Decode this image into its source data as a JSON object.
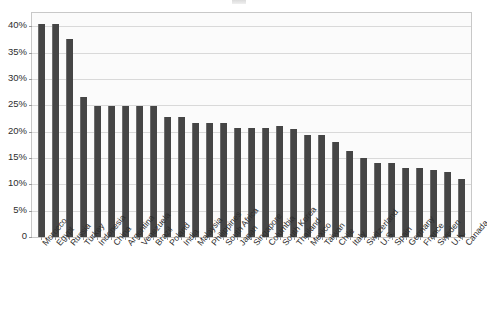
{
  "chart_data": {
    "type": "bar",
    "title": "",
    "xlabel": "",
    "ylabel": "",
    "ylim": [
      0,
      42.5
    ],
    "grid": true,
    "legend": null,
    "y_tick_labels": [
      "40%",
      "35%",
      "30%",
      "25%",
      "20%",
      "15%",
      "10%",
      "5%",
      "0"
    ],
    "y_tick_values": [
      40,
      35,
      30,
      25,
      20,
      15,
      10,
      5,
      0
    ],
    "value_suffix": "%",
    "categories": [
      "Morocco",
      "Egypt",
      "Russia",
      "Turkey",
      "Indonesia",
      "China",
      "Argentina",
      "Venezuela",
      "Brazil",
      "Poland",
      "India",
      "Malaysia",
      "Philippines",
      "South Africa",
      "Japan",
      "Singapore",
      "Columbia",
      "South Korea",
      "Thailand",
      "Mexico",
      "Taiwan",
      "Chile",
      "Italy",
      "Switzerland",
      "U.S.",
      "Spain",
      "Germany",
      "France",
      "Sweden",
      "U.K.",
      "Canada"
    ],
    "values": [
      40.5,
      40.5,
      37.5,
      26.5,
      24.8,
      24.8,
      24.8,
      24.8,
      24.8,
      22.7,
      22.7,
      21.7,
      21.7,
      21.7,
      20.7,
      20.7,
      20.7,
      21.0,
      20.4,
      19.3,
      19.3,
      18.0,
      16.3,
      15.0,
      14.0,
      14.0,
      13.0,
      13.0,
      12.8,
      12.3,
      11.0
    ]
  },
  "colors": {
    "bar": "#454545",
    "bar_edge": "#6d6d6d",
    "plot_background": "#fbfbfb",
    "plot_border": "#c8c8c8",
    "gridline": "#d9d9d9",
    "text": "#2e2e2e",
    "page_background": "#ffffff"
  }
}
